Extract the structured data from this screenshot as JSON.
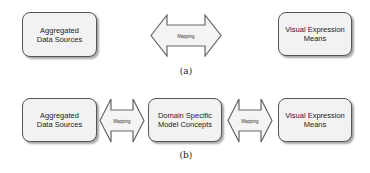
{
  "diagram_a": {
    "left_box": "Aggregated Data Sources",
    "arrow_label": "Mapping",
    "right_box": "Visual Expression Means",
    "caption": "(a)"
  },
  "diagram_b": {
    "left_box": "Aggregated Data Sources",
    "left_arrow_label": "Mapping",
    "middle_box": "Domain Specific Model Concepts",
    "right_arrow_label": "Mapping",
    "right_box": "Visual Expression Means",
    "caption": "(b)"
  },
  "colors": {
    "box_fill": "#f2f2f2",
    "box_border": "#555555",
    "arrow_fill": "#f4f4f4",
    "arrow_border": "#666666"
  }
}
